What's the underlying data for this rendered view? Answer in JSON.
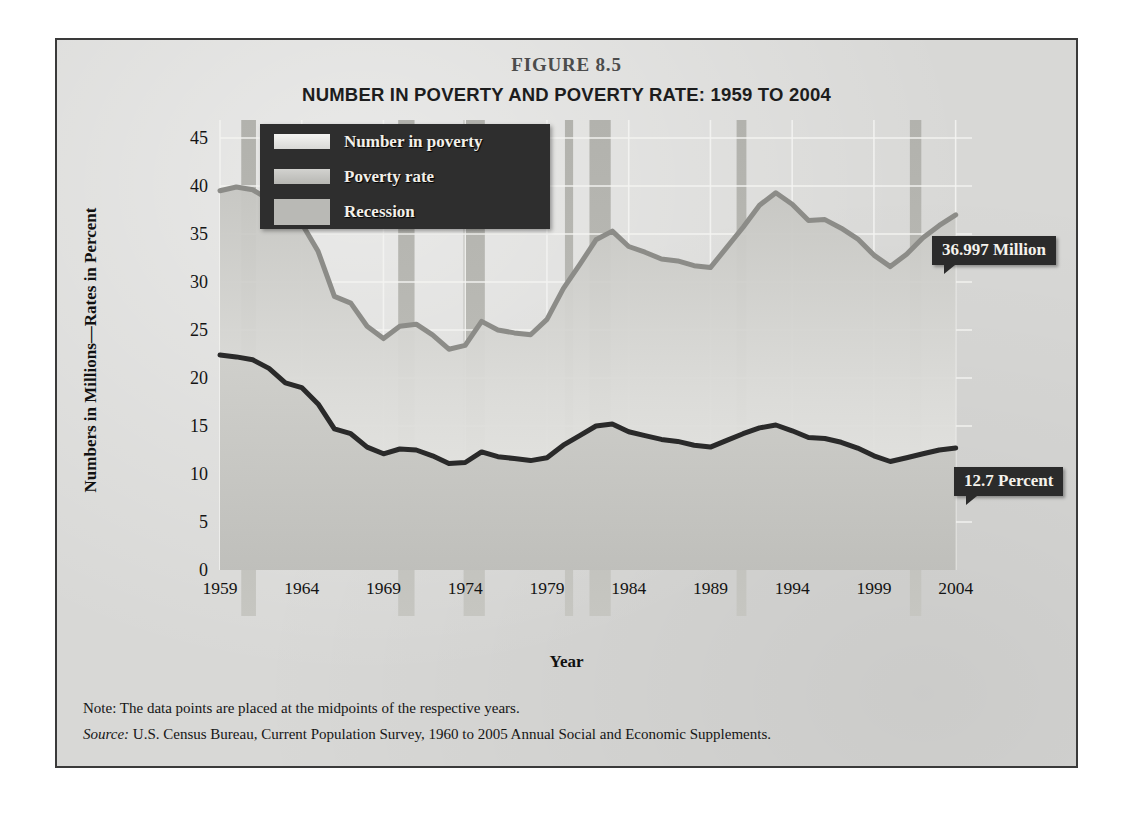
{
  "figure": {
    "number": "FIGURE 8.5",
    "title": "NUMBER IN POVERTY AND POVERTY RATE: 1959 TO 2004",
    "note_label": "Note:",
    "note_text": " The data points are placed at the midpoints of the respective years.",
    "source_label": "Source:",
    "source_text": " U.S. Census Bureau, Current Population Survey, 1960 to 2005 Annual Social and Economic Supplements."
  },
  "legend": {
    "items": [
      {
        "label": "Number in poverty",
        "swatch": "number-swatch",
        "color": "#eeeeec"
      },
      {
        "label": "Poverty rate",
        "swatch": "rate-swatch",
        "color": "#c9c9c5"
      },
      {
        "label": "Recession",
        "swatch": "recession-swatch",
        "color": "#b9b9b5"
      }
    ]
  },
  "callouts": {
    "number_in_poverty": "36.997 Million",
    "poverty_rate": "12.7 Percent"
  },
  "colors": {
    "panel_background": "#d8d8d6",
    "frame_border": "#3a3a3a",
    "number_line": "#8c8c88",
    "rate_line": "#2a2a2a",
    "recession_band": "#b9b9b5",
    "gridline": "#f2f2f0",
    "callout_background": "#2b2b2b",
    "legend_background": "#2e2e2e"
  },
  "chart_data": {
    "type": "line",
    "title": "NUMBER IN POVERTY AND POVERTY RATE: 1959 TO 2004",
    "xlabel": "Year",
    "ylabel": "Numbers in Millions—Rates in Percent",
    "xlim": [
      1959,
      2005
    ],
    "ylim": [
      0,
      45
    ],
    "yticks": [
      0,
      5,
      10,
      15,
      20,
      25,
      30,
      35,
      40,
      45
    ],
    "xticks": [
      1959,
      1964,
      1969,
      1974,
      1979,
      1984,
      1989,
      1994,
      1999,
      2004
    ],
    "grid": true,
    "legend_position": "upper-left-inside",
    "x": [
      1959,
      1960,
      1961,
      1962,
      1963,
      1964,
      1965,
      1966,
      1967,
      1968,
      1969,
      1970,
      1971,
      1972,
      1973,
      1974,
      1975,
      1976,
      1977,
      1978,
      1979,
      1980,
      1981,
      1982,
      1983,
      1984,
      1985,
      1986,
      1987,
      1988,
      1989,
      1990,
      1991,
      1992,
      1993,
      1994,
      1995,
      1996,
      1997,
      1998,
      1999,
      2000,
      2001,
      2002,
      2003,
      2004
    ],
    "series": [
      {
        "name": "Number in poverty",
        "units": "millions",
        "color": "#8c8c88",
        "values": [
          39.5,
          39.9,
          39.6,
          38.6,
          36.4,
          36.1,
          33.2,
          28.5,
          27.8,
          25.4,
          24.1,
          25.4,
          25.6,
          24.5,
          23.0,
          23.4,
          25.9,
          25.0,
          24.7,
          24.5,
          26.1,
          29.3,
          31.8,
          34.4,
          35.3,
          33.7,
          33.1,
          32.4,
          32.2,
          31.7,
          31.5,
          33.6,
          35.7,
          38.0,
          39.3,
          38.1,
          36.4,
          36.5,
          35.6,
          34.5,
          32.8,
          31.6,
          32.9,
          34.6,
          35.9,
          37.0
        ]
      },
      {
        "name": "Poverty rate",
        "units": "percent",
        "color": "#2a2a2a",
        "values": [
          22.4,
          22.2,
          21.9,
          21.0,
          19.5,
          19.0,
          17.3,
          14.7,
          14.2,
          12.8,
          12.1,
          12.6,
          12.5,
          11.9,
          11.1,
          11.2,
          12.3,
          11.8,
          11.6,
          11.4,
          11.7,
          13.0,
          14.0,
          15.0,
          15.2,
          14.4,
          14.0,
          13.6,
          13.4,
          13.0,
          12.8,
          13.5,
          14.2,
          14.8,
          15.1,
          14.5,
          13.8,
          13.7,
          13.3,
          12.7,
          11.9,
          11.3,
          11.7,
          12.1,
          12.5,
          12.7
        ]
      }
    ],
    "recessions": [
      {
        "start": 1960.3,
        "end": 1961.2
      },
      {
        "start": 1969.9,
        "end": 1970.9
      },
      {
        "start": 1973.9,
        "end": 1975.2
      },
      {
        "start": 1980.1,
        "end": 1980.6
      },
      {
        "start": 1981.6,
        "end": 1982.9
      },
      {
        "start": 1990.6,
        "end": 1991.2
      },
      {
        "start": 2001.2,
        "end": 2001.9
      }
    ],
    "annotations": [
      {
        "text": "36.997 Million",
        "series": "Number in poverty",
        "x": 2004,
        "y": 37.0
      },
      {
        "text": "12.7 Percent",
        "series": "Poverty rate",
        "x": 2004,
        "y": 12.7
      }
    ]
  }
}
